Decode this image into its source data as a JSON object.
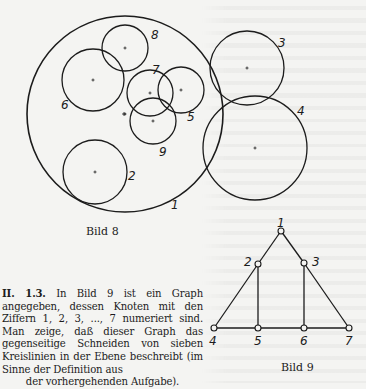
{
  "figure8": {
    "caption": "Bild 8",
    "circles": [
      {
        "label": "1",
        "cx": 125,
        "cy": 114,
        "r": 98,
        "label_x": 171,
        "label_y": 209
      },
      {
        "label": "2",
        "cx": 95,
        "cy": 172,
        "r": 32,
        "label_x": 128,
        "label_y": 180
      },
      {
        "label": "3",
        "cx": 247,
        "cy": 68,
        "r": 37,
        "label_x": 278,
        "label_y": 47
      },
      {
        "label": "4",
        "cx": 255,
        "cy": 148,
        "r": 52,
        "label_x": 297,
        "label_y": 115
      },
      {
        "label": "5",
        "cx": 181,
        "cy": 90,
        "r": 23,
        "label_x": 187,
        "label_y": 121
      },
      {
        "label": "6",
        "cx": 93,
        "cy": 80,
        "r": 31,
        "label_x": 61,
        "label_y": 109
      },
      {
        "label": "7",
        "cx": 150,
        "cy": 93,
        "r": 23,
        "label_x": 152,
        "label_y": 74
      },
      {
        "label": "8",
        "cx": 125,
        "cy": 48,
        "r": 23,
        "label_x": 151,
        "label_y": 39
      },
      {
        "label": "9",
        "cx": 153,
        "cy": 121,
        "r": 23,
        "label_x": 159,
        "label_y": 156
      }
    ],
    "extra_center_mark": {
      "x": 124,
      "y": 114
    }
  },
  "figure9": {
    "caption": "Bild 9",
    "nodes": [
      {
        "id": "1",
        "x": 281,
        "y": 231,
        "label_x": 277,
        "label_y": 227
      },
      {
        "id": "2",
        "x": 258,
        "y": 264,
        "label_x": 244,
        "label_y": 266
      },
      {
        "id": "3",
        "x": 304,
        "y": 263,
        "label_x": 312,
        "label_y": 266
      },
      {
        "id": "4",
        "x": 214,
        "y": 328,
        "label_x": 209,
        "label_y": 345
      },
      {
        "id": "5",
        "x": 258,
        "y": 328,
        "label_x": 254,
        "label_y": 345
      },
      {
        "id": "6",
        "x": 304,
        "y": 328,
        "label_x": 300,
        "label_y": 345
      },
      {
        "id": "7",
        "x": 349,
        "y": 328,
        "label_x": 345,
        "label_y": 345
      }
    ],
    "edges": [
      [
        "1",
        "2"
      ],
      [
        "1",
        "3"
      ],
      [
        "2",
        "4"
      ],
      [
        "2",
        "5"
      ],
      [
        "3",
        "6"
      ],
      [
        "3",
        "7"
      ],
      [
        "4",
        "5"
      ],
      [
        "5",
        "6"
      ],
      [
        "6",
        "7"
      ]
    ]
  },
  "problem": {
    "number": "II. 1.3.",
    "text_main": "In Bild 9 ist ein Graph angegeben, dessen Knoten mit den Ziffern 1, 2, 3, ..., 7 numeriert sind. Man zeige, daß dieser Graph das gegenseitige Schneiden von sieben Kreislinien in der Ebene beschreibt (im Sinne der Definition aus",
    "text_last": "der vorhergehenden Aufgabe)."
  }
}
